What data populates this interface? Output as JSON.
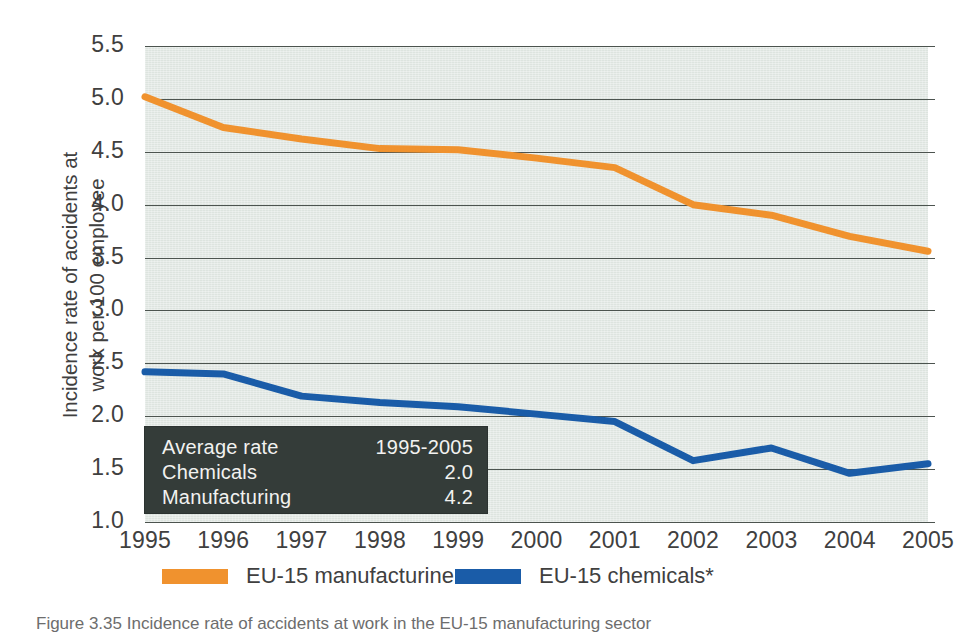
{
  "figure": {
    "caption": "Figure  3.35   Incidence rate of accidents at work in the EU-15 manufacturing sector"
  },
  "inset": {
    "rows": [
      {
        "label": "Average rate",
        "value": "1995-2005"
      },
      {
        "label": "Chemicals",
        "value": "2.0"
      },
      {
        "label": "Manufacturing",
        "value": "4.2"
      }
    ]
  },
  "legend": {
    "items": [
      {
        "label": "EU-15 manufacturine",
        "color": "#f0922e"
      },
      {
        "label": "EU-15 chemicals*",
        "color": "#1a5ca8"
      }
    ]
  },
  "chart_data": {
    "type": "line",
    "title": "",
    "subtitle": "",
    "xlabel": "",
    "ylabel": "Incidence rate of accidents at work per 100 employee",
    "ylabel_lines": [
      "Incidence rate of accidents at",
      "work per 100 employee"
    ],
    "x": [
      1995,
      1996,
      1997,
      1998,
      1999,
      2000,
      2001,
      2002,
      2003,
      2004,
      2005
    ],
    "categories": [
      "1995",
      "1996",
      "1997",
      "1998",
      "1999",
      "2000",
      "2001",
      "2002",
      "2003",
      "2004",
      "2005"
    ],
    "ylim": [
      1.0,
      5.5
    ],
    "yticks": [
      5.5,
      5.0,
      4.5,
      4.0,
      3.5,
      3.0,
      2.5,
      2.0,
      1.5,
      1.0
    ],
    "ytick_labels": [
      "5.5",
      "5.0",
      "4.5",
      "4.0",
      "3.5",
      "3.0",
      "2.5",
      "2.0",
      "1.5",
      "1.0"
    ],
    "grid": true,
    "grid_axis": "y",
    "legend_position": "bottom",
    "plot_background": "#dde4df",
    "series": [
      {
        "name": "EU-15 manufacturine",
        "color": "#f0922e",
        "values": [
          5.02,
          4.73,
          4.62,
          4.53,
          4.52,
          4.44,
          4.35,
          4.0,
          3.9,
          3.7,
          3.56
        ]
      },
      {
        "name": "EU-15 chemicals*",
        "color": "#1a5ca8",
        "values": [
          2.42,
          2.4,
          2.19,
          2.13,
          2.09,
          2.02,
          1.95,
          1.58,
          1.7,
          1.46,
          1.55
        ]
      }
    ]
  }
}
